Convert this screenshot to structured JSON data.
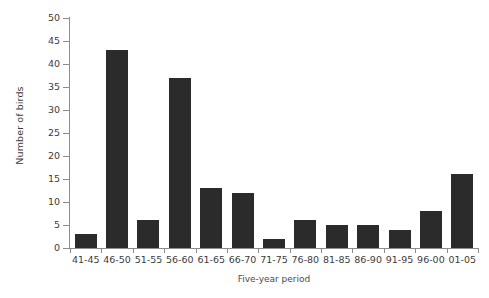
{
  "chart_data": {
    "type": "bar",
    "title": "",
    "xlabel": "Five-year period",
    "ylabel": "Number of birds",
    "categories": [
      "41-45",
      "46-50",
      "51-55",
      "56-60",
      "61-65",
      "66-70",
      "71-75",
      "76-80",
      "81-85",
      "86-90",
      "91-95",
      "96-00",
      "01-05"
    ],
    "values": [
      3,
      43,
      6,
      37,
      13,
      12,
      2,
      6,
      5,
      5,
      4,
      8,
      16
    ],
    "ylim": [
      0,
      50
    ],
    "ytick_step": 5,
    "ytick_labels": [
      "0",
      "5",
      "10",
      "15",
      "20",
      "25",
      "30",
      "35",
      "40",
      "45",
      "50"
    ],
    "grid": false,
    "legend": null,
    "bar_color": "#2b2b2b",
    "axis_color": "#8d8d8d",
    "background_color": "#ffffff"
  }
}
